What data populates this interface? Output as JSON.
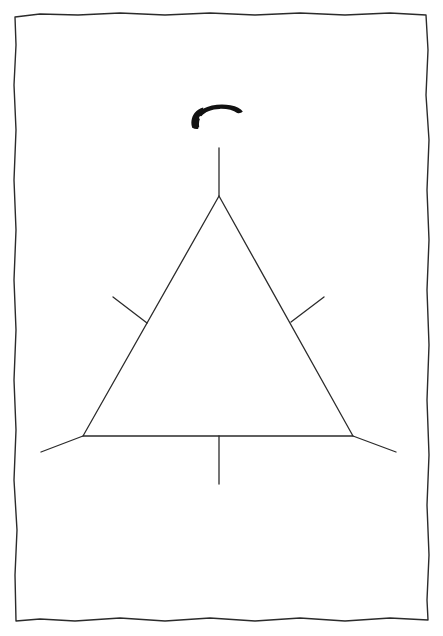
{
  "document": {
    "kind": "scanned-line-drawing",
    "page_width": 443,
    "page_height": 636,
    "background_color": "#ffffff",
    "ink_color": "#1a1a1a",
    "caption": "",
    "title": ""
  },
  "frame": {
    "name": "page-border",
    "style": "hand-drawn rectangle",
    "stroke_color": "#2b2b2b",
    "stroke_width": 1.4,
    "left": 14,
    "top": 13,
    "right": 428,
    "bottom": 620
  },
  "figure": {
    "name": "triangle-with-tick-marks",
    "stroke_color": "#2b2b2b",
    "stroke_width": 1.3,
    "triangle": {
      "apex": {
        "x": 219,
        "y": 196
      },
      "bottom_left": {
        "x": 83,
        "y": 436
      },
      "bottom_right": {
        "x": 353,
        "y": 436
      }
    },
    "marks": [
      {
        "id": "apex-vertical-tick",
        "label": "apex vertical tick",
        "from": {
          "x": 219,
          "y": 148
        },
        "to": {
          "x": 219,
          "y": 196
        }
      },
      {
        "id": "left-side-tick",
        "label": "left side perpendicular tick",
        "from": {
          "x": 113,
          "y": 297
        },
        "to": {
          "x": 147,
          "y": 323
        }
      },
      {
        "id": "right-side-tick",
        "label": "right side perpendicular tick",
        "from": {
          "x": 324,
          "y": 297
        },
        "to": {
          "x": 291,
          "y": 322
        }
      },
      {
        "id": "base-center-tick",
        "label": "base center vertical tick",
        "from": {
          "x": 219,
          "y": 436
        },
        "to": {
          "x": 219,
          "y": 484
        }
      },
      {
        "id": "bottom-left-extension",
        "label": "bottom left corner extension",
        "from": {
          "x": 83,
          "y": 436
        },
        "to": {
          "x": 41,
          "y": 452
        }
      },
      {
        "id": "bottom-right-extension",
        "label": "bottom right corner extension",
        "from": {
          "x": 353,
          "y": 436
        },
        "to": {
          "x": 396,
          "y": 452
        }
      }
    ]
  },
  "arc_emblem": {
    "name": "curved-black-arc-with-dots",
    "description": "solid black curved band tapering to a point at the left, pierced by a row of white circular holes",
    "fill_color": "#111111",
    "hole_color": "#ffffff",
    "bounds": {
      "x": 191,
      "y": 104,
      "width": 52,
      "height": 25
    },
    "hole_count": 7,
    "holes": [
      {
        "cx": 207.5,
        "cy": 114.5,
        "r": 2.2
      },
      {
        "cx": 213.5,
        "cy": 112.9,
        "r": 2.3
      },
      {
        "cx": 219.5,
        "cy": 112.2,
        "r": 2.3
      },
      {
        "cx": 225.5,
        "cy": 112.4,
        "r": 2.3
      },
      {
        "cx": 231.2,
        "cy": 113.4,
        "r": 2.2
      },
      {
        "cx": 236.4,
        "cy": 115.0,
        "r": 2.0
      },
      {
        "cx": 200.8,
        "cy": 117.8,
        "r": 1.7
      }
    ]
  },
  "chart_data": {
    "type": "diagram",
    "title": "",
    "elements": [
      {
        "name": "triangle",
        "vertices": [
          [
            219,
            196
          ],
          [
            83,
            436
          ],
          [
            353,
            436
          ]
        ]
      },
      {
        "name": "apex-tick",
        "points": [
          [
            219,
            148
          ],
          [
            219,
            196
          ]
        ]
      },
      {
        "name": "left-tick",
        "points": [
          [
            113,
            297
          ],
          [
            147,
            323
          ]
        ]
      },
      {
        "name": "right-tick",
        "points": [
          [
            324,
            297
          ],
          [
            291,
            322
          ]
        ]
      },
      {
        "name": "base-tick",
        "points": [
          [
            219,
            436
          ],
          [
            219,
            484
          ]
        ]
      },
      {
        "name": "left-extension",
        "points": [
          [
            83,
            436
          ],
          [
            41,
            452
          ]
        ]
      },
      {
        "name": "right-extension",
        "points": [
          [
            353,
            436
          ],
          [
            396,
            452
          ]
        ]
      },
      {
        "name": "arc-emblem",
        "center": [
          217,
          116
        ],
        "holes": 7
      }
    ]
  }
}
